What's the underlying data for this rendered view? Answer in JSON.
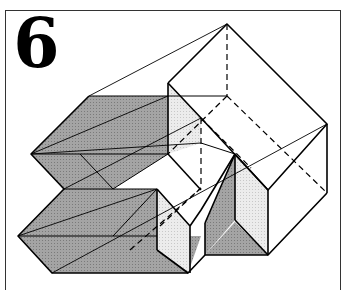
{
  "figure": {
    "number": "6",
    "caption": "",
    "colors": {
      "line": "#000000",
      "shade_dark": "#9a9a9a",
      "shade_light": "#e4e4e4",
      "frame": "#333333",
      "background": "#ffffff"
    }
  }
}
